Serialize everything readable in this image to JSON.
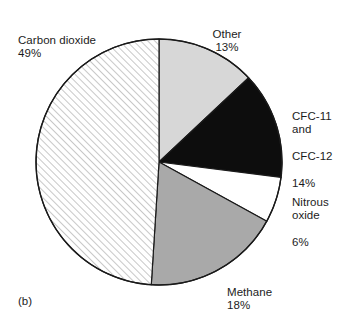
{
  "figure": {
    "caption": "(b)",
    "background_color": "#ffffff",
    "text_color": "#1c1c1c"
  },
  "labels": {
    "carbon_dioxide": {
      "name": "Carbon dioxide",
      "percent": "49%"
    },
    "other": {
      "name": "Other",
      "percent": "13%"
    },
    "cfc": {
      "line1": "CFC-11",
      "line2": "and",
      "line3": "CFC-12",
      "percent": "14%"
    },
    "nitrous_oxide": {
      "line1": "Nitrous",
      "line2": "oxide",
      "percent": "6%"
    },
    "methane": {
      "name": "Methane",
      "percent": "18%"
    }
  },
  "chart_data": {
    "type": "pie",
    "title": "",
    "subtitle": "",
    "xlabel": "",
    "ylabel": "",
    "legend_position": "none",
    "grid": false,
    "start_angle_deg": 0,
    "direction": "clockwise",
    "center": {
      "cx": 159,
      "cy": 162
    },
    "radius": 123,
    "outline_color": "#1a1a1a",
    "outline_width": 1.4,
    "categories": [
      "Other",
      "CFC-11 and CFC-12",
      "Nitrous oxide",
      "Methane",
      "Carbon dioxide"
    ],
    "values": [
      13,
      14,
      6,
      18,
      49
    ],
    "value_labels": [
      "13%",
      "14%",
      "6%",
      "18%",
      "49%"
    ],
    "units": "percent",
    "total": 100,
    "slices": [
      {
        "label": "Other",
        "value": 13,
        "value_label": "13%",
        "fill": "#d7d7d7",
        "fill_kind": "solid",
        "start_deg": 0.0,
        "end_deg": 46.8
      },
      {
        "label": "CFC-11 and CFC-12",
        "value": 14,
        "value_label": "14%",
        "fill": "#0d0d0d",
        "fill_kind": "solid",
        "start_deg": 46.8,
        "end_deg": 97.2
      },
      {
        "label": "Nitrous oxide",
        "value": 6,
        "value_label": "6%",
        "fill": "#ffffff",
        "fill_kind": "solid",
        "start_deg": 97.2,
        "end_deg": 118.8
      },
      {
        "label": "Methane",
        "value": 18,
        "value_label": "18%",
        "fill": "#a9a9a9",
        "fill_kind": "solid",
        "start_deg": 118.8,
        "end_deg": 183.6
      },
      {
        "label": "Carbon dioxide",
        "value": 49,
        "value_label": "49%",
        "fill": "#ffffff",
        "fill_kind": "hatch-diagonal",
        "hatch_color": "#9a9a9a",
        "start_deg": 183.6,
        "end_deg": 360.0
      }
    ]
  }
}
